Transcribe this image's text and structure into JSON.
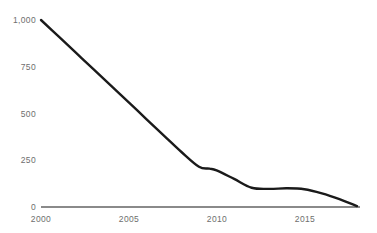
{
  "chart_data": {
    "type": "line",
    "title": "",
    "subtitle": "",
    "xlabel": "",
    "ylabel": "",
    "xlim": [
      2000,
      2018
    ],
    "ylim": [
      0,
      1000
    ],
    "grid": true,
    "legend": false,
    "legend_position": "none",
    "xtick_labels": [
      "2000",
      "2005",
      "2010",
      "2015"
    ],
    "xticks": [
      2000,
      2005,
      2010,
      2015
    ],
    "ytick_labels": [
      "0",
      "250",
      "500",
      "750",
      "1,000"
    ],
    "yticks": [
      0,
      250,
      500,
      750,
      1000
    ],
    "series": [
      {
        "name": "series-1",
        "color": "#1a1a1a",
        "line_width": 2.4,
        "x": [
          2000,
          2001,
          2002,
          2003,
          2004,
          2005,
          2006,
          2007,
          2008,
          2009,
          2009.6,
          2010,
          2011,
          2012,
          2013,
          2014,
          2015,
          2016,
          2017,
          2018
        ],
        "values": [
          1000,
          912,
          824,
          736,
          648,
          560,
          470,
          382,
          294,
          215,
          205,
          196,
          150,
          103,
          97,
          100,
          95,
          73,
          42,
          5
        ]
      }
    ],
    "annotations": []
  },
  "style": {
    "background": "#ffffff",
    "grid_color": "#ebebeb",
    "axis_color": "#8a8a8a",
    "tick_label_color": "#6e6e6e",
    "series_color": "#1a1a1a"
  }
}
